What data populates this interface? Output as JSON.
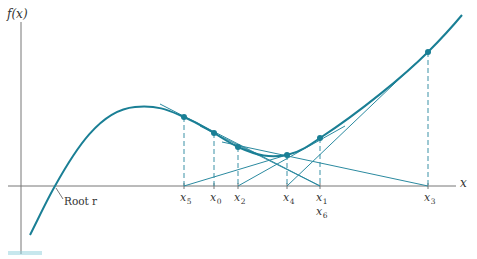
{
  "figure": {
    "y_axis_label": "f(x)",
    "x_axis_label": "x",
    "root_label": "Root r",
    "colors": {
      "curve": "#1a7f95",
      "tangent": "#2b8aa0",
      "dashed": "#3b91a6",
      "axes": "#777777",
      "text": "#333333"
    },
    "iterates": [
      {
        "name": "x0",
        "base": "x",
        "sub": "0",
        "axis_x": 214,
        "point_y": 133
      },
      {
        "name": "x1",
        "base": "x",
        "sub": "1",
        "axis_x": 320,
        "point_y": 138
      },
      {
        "name": "x2",
        "base": "x",
        "sub": "2",
        "axis_x": 238,
        "point_y": 147
      },
      {
        "name": "x3",
        "base": "x",
        "sub": "3",
        "axis_x": 428,
        "point_y": 52
      },
      {
        "name": "x4",
        "base": "x",
        "sub": "4",
        "axis_x": 287,
        "point_y": 155
      },
      {
        "name": "x5",
        "base": "x",
        "sub": "5",
        "axis_x": 184,
        "point_y": 117
      },
      {
        "name": "x6",
        "base": "x",
        "sub": "6",
        "axis_x": 320,
        "note": "x6 coincides with x1"
      }
    ],
    "tangent_sequence": [
      {
        "from": "x0",
        "to": "x1"
      },
      {
        "from": "x1",
        "to": "x2"
      },
      {
        "from": "x2",
        "to": "x3"
      },
      {
        "from": "x3",
        "to": "x4"
      },
      {
        "from": "x4",
        "to": "x5"
      },
      {
        "from": "x5",
        "to": "x6"
      }
    ]
  }
}
